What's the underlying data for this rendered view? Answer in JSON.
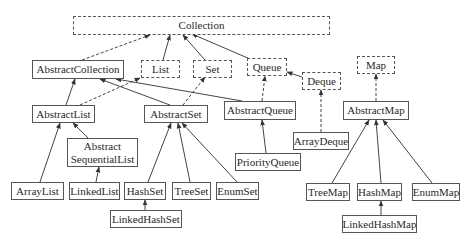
{
  "diagram": {
    "nodes": {
      "collection": {
        "label": "Collection",
        "kind": "interface"
      },
      "list": {
        "label": "List",
        "kind": "interface"
      },
      "set": {
        "label": "Set",
        "kind": "interface"
      },
      "queue": {
        "label": "Queue",
        "kind": "interface"
      },
      "deque": {
        "label": "Deque",
        "kind": "interface"
      },
      "map": {
        "label": "Map",
        "kind": "interface"
      },
      "abstract_collection": {
        "label": "AbstractCollection",
        "kind": "class"
      },
      "abstract_list": {
        "label": "AbstractList",
        "kind": "class"
      },
      "abstract_set": {
        "label": "AbstractSet",
        "kind": "class"
      },
      "abstract_queue": {
        "label": "AbstractQueue",
        "kind": "class"
      },
      "abstract_map": {
        "label": "AbstractMap",
        "kind": "class"
      },
      "abstract_sequential_list": {
        "label_line1": "Abstract",
        "label_line2": "SequentialList",
        "kind": "class"
      },
      "array_deque": {
        "label": "ArrayDeque",
        "kind": "class"
      },
      "priority_queue": {
        "label": "PriorityQueue",
        "kind": "class"
      },
      "array_list": {
        "label": "ArrayList",
        "kind": "class"
      },
      "linked_list": {
        "label": "LinkedList",
        "kind": "class"
      },
      "hash_set": {
        "label": "HashSet",
        "kind": "class"
      },
      "tree_set": {
        "label": "TreeSet",
        "kind": "class"
      },
      "enum_set": {
        "label": "EnumSet",
        "kind": "class"
      },
      "tree_map": {
        "label": "TreeMap",
        "kind": "class"
      },
      "hash_map": {
        "label": "HashMap",
        "kind": "class"
      },
      "enum_map": {
        "label": "EnumMap",
        "kind": "class"
      },
      "linked_hash_set": {
        "label": "LinkedHashSet",
        "kind": "class"
      },
      "linked_hash_map": {
        "label": "LinkedHashMap",
        "kind": "class"
      }
    },
    "edges": [
      {
        "from": "AbstractCollection",
        "to": "Collection",
        "style": "dashed"
      },
      {
        "from": "List",
        "to": "Collection",
        "style": "solid"
      },
      {
        "from": "Set",
        "to": "Collection",
        "style": "solid"
      },
      {
        "from": "Queue",
        "to": "Collection",
        "style": "solid"
      },
      {
        "from": "Deque",
        "to": "Queue",
        "style": "solid"
      },
      {
        "from": "AbstractList",
        "to": "AbstractCollection",
        "style": "solid"
      },
      {
        "from": "AbstractList",
        "to": "List",
        "style": "dashed"
      },
      {
        "from": "AbstractSet",
        "to": "AbstractCollection",
        "style": "solid"
      },
      {
        "from": "AbstractSet",
        "to": "Set",
        "style": "dashed"
      },
      {
        "from": "AbstractQueue",
        "to": "AbstractCollection",
        "style": "solid"
      },
      {
        "from": "AbstractQueue",
        "to": "Queue",
        "style": "dashed"
      },
      {
        "from": "ArrayDeque",
        "to": "Deque",
        "style": "dashed"
      },
      {
        "from": "AbstractMap",
        "to": "Map",
        "style": "dashed"
      },
      {
        "from": "AbstractSequentialList",
        "to": "AbstractList",
        "style": "solid"
      },
      {
        "from": "ArrayList",
        "to": "AbstractList",
        "style": "solid"
      },
      {
        "from": "LinkedList",
        "to": "AbstractSequentialList",
        "style": "solid"
      },
      {
        "from": "HashSet",
        "to": "AbstractSet",
        "style": "solid"
      },
      {
        "from": "TreeSet",
        "to": "AbstractSet",
        "style": "solid"
      },
      {
        "from": "EnumSet",
        "to": "AbstractSet",
        "style": "solid"
      },
      {
        "from": "LinkedHashSet",
        "to": "HashSet",
        "style": "solid"
      },
      {
        "from": "PriorityQueue",
        "to": "AbstractQueue",
        "style": "solid"
      },
      {
        "from": "TreeMap",
        "to": "AbstractMap",
        "style": "solid"
      },
      {
        "from": "HashMap",
        "to": "AbstractMap",
        "style": "solid"
      },
      {
        "from": "EnumMap",
        "to": "AbstractMap",
        "style": "solid"
      },
      {
        "from": "LinkedHashMap",
        "to": "HashMap",
        "style": "solid"
      }
    ],
    "colors": {
      "line": "#444444",
      "border": "#555555",
      "text": "#2a2a2a",
      "background": "#ffffff"
    }
  }
}
